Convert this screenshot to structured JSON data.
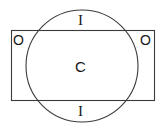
{
  "figure": {
    "name": "rectangle-circle-overlap-diagram",
    "width": 163,
    "height": 130,
    "background_color": "#ffffff",
    "stroke_color": "#3a3a3a",
    "text_color": "#161616"
  },
  "shapes": {
    "rectangle": {
      "name": "rectangle-outline",
      "x": 11,
      "y": 30,
      "width": 144,
      "height": 71
    },
    "circle": {
      "name": "circle-outline",
      "cx": 82,
      "cy": 66,
      "r": 56
    }
  },
  "labels": {
    "outside_left": "O",
    "outside_right": "O",
    "inside_top": "I",
    "inside_bottom": "I",
    "common_center": "C"
  }
}
